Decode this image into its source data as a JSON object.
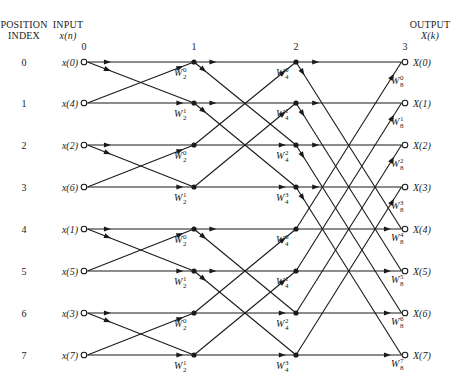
{
  "headers": {
    "position_index": [
      "POSITION",
      "INDEX"
    ],
    "input": [
      "INPUT",
      "x(n)"
    ],
    "output": [
      "OUTPUT",
      "X(k)"
    ]
  },
  "stages": [
    {
      "label": "0",
      "x": 84
    },
    {
      "label": "1",
      "x": 194
    },
    {
      "label": "2",
      "x": 296
    },
    {
      "label": "3",
      "x": 405
    }
  ],
  "rows_y": [
    62,
    103,
    145,
    187,
    229,
    271,
    313,
    355
  ],
  "position_indices": [
    "0",
    "1",
    "2",
    "3",
    "4",
    "5",
    "6",
    "7"
  ],
  "inputs": [
    "x(0)",
    "x(4)",
    "x(2)",
    "x(6)",
    "x(1)",
    "x(5)",
    "x(3)",
    "x(7)"
  ],
  "outputs": [
    "X(0)",
    "X(1)",
    "X(2)",
    "X(3)",
    "X(4)",
    "X(5)",
    "X(6)",
    "X(7)"
  ],
  "twiddles": {
    "stage1": [
      {
        "row": 0,
        "base": "W",
        "sub": "2",
        "sup": "0"
      },
      {
        "row": 1,
        "base": "W",
        "sub": "2",
        "sup": "1"
      },
      {
        "row": 2,
        "base": "W",
        "sub": "2",
        "sup": "0"
      },
      {
        "row": 3,
        "base": "W",
        "sub": "2",
        "sup": "1"
      },
      {
        "row": 4,
        "base": "W",
        "sub": "2",
        "sup": "0"
      },
      {
        "row": 5,
        "base": "W",
        "sub": "2",
        "sup": "1"
      },
      {
        "row": 6,
        "base": "W",
        "sub": "2",
        "sup": "0"
      },
      {
        "row": 7,
        "base": "W",
        "sub": "2",
        "sup": "1"
      }
    ],
    "stage2": [
      {
        "row": 0,
        "base": "W",
        "sub": "4",
        "sup": "0"
      },
      {
        "row": 1,
        "base": "W",
        "sub": "4",
        "sup": "1"
      },
      {
        "row": 2,
        "base": "W",
        "sub": "4",
        "sup": "2"
      },
      {
        "row": 3,
        "base": "W",
        "sub": "4",
        "sup": "3"
      },
      {
        "row": 4,
        "base": "W",
        "sub": "4",
        "sup": "0"
      },
      {
        "row": 5,
        "base": "W",
        "sub": "4",
        "sup": "1"
      },
      {
        "row": 6,
        "base": "W",
        "sub": "4",
        "sup": "2"
      },
      {
        "row": 7,
        "base": "W",
        "sub": "4",
        "sup": "3"
      }
    ],
    "stage3": [
      {
        "row": 0,
        "base": "W",
        "sub": "8",
        "sup": "0"
      },
      {
        "row": 1,
        "base": "W",
        "sub": "8",
        "sup": "1"
      },
      {
        "row": 2,
        "base": "W",
        "sub": "8",
        "sup": "2"
      },
      {
        "row": 3,
        "base": "W",
        "sub": "8",
        "sup": "3"
      },
      {
        "row": 4,
        "base": "W",
        "sub": "8",
        "sup": "4"
      },
      {
        "row": 5,
        "base": "W",
        "sub": "8",
        "sup": "5"
      },
      {
        "row": 6,
        "base": "W",
        "sub": "8",
        "sup": "6"
      },
      {
        "row": 7,
        "base": "W",
        "sub": "8",
        "sup": "7"
      }
    ]
  },
  "butterfly_spans": [
    1,
    2,
    4
  ],
  "colors": {
    "ink": "#1a1a1a",
    "background": "#ffffff"
  }
}
